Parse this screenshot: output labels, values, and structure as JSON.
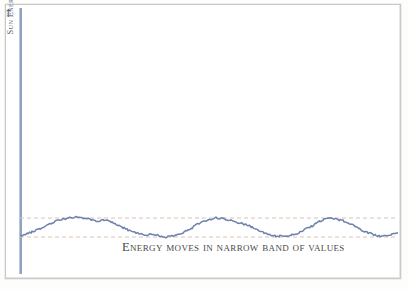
{
  "figure": {
    "background_color": "#ffffff",
    "frame_color": "#c9c9c9"
  },
  "axis": {
    "y_label": "Sun Energy",
    "y_arrow_glyph": "↑",
    "axis_color": "#8fa2bf"
  },
  "caption": {
    "text": "Energy moves in narrow band of values",
    "color": "#4a4a4a"
  },
  "chart_data": {
    "type": "line",
    "title": "",
    "subtitle": "",
    "xlabel": "",
    "ylabel": "Sun Energy",
    "annotations": [
      "Energy moves in narrow band of values"
    ],
    "legend": [],
    "legend_position": "none",
    "grid": false,
    "xlim": [
      0,
      378
    ],
    "ylim": [
      0,
      266
    ],
    "series_color": "#6d82ab",
    "band": {
      "label": "narrow band of values",
      "upper_y": 210,
      "lower_y": 229,
      "line_style": "dashed",
      "color": "#d8c4b4"
    },
    "series": [
      {
        "name": "Sun energy",
        "x": [
          0,
          4,
          8,
          12,
          16,
          20,
          24,
          28,
          32,
          36,
          40,
          44,
          48,
          52,
          56,
          60,
          64,
          68,
          72,
          76,
          80,
          84,
          88,
          92,
          96,
          100,
          104,
          108,
          112,
          116,
          120,
          124,
          128,
          132,
          136,
          140,
          144,
          148,
          152,
          156,
          160,
          164,
          168,
          172,
          176,
          180,
          184,
          188,
          192,
          196,
          200,
          204,
          208,
          212,
          216,
          220,
          224,
          228,
          232,
          236,
          240,
          244,
          248,
          252,
          256,
          260,
          264,
          268,
          272,
          276,
          280,
          284,
          288,
          292,
          296,
          300,
          304,
          308,
          312,
          316,
          320,
          324,
          328,
          332,
          336,
          340,
          344,
          348,
          352,
          356,
          360,
          364,
          368,
          372,
          378
        ],
        "y": [
          228,
          227,
          225,
          224,
          222,
          221,
          219,
          217,
          215,
          213,
          212,
          211,
          210,
          210,
          209,
          209,
          210,
          211,
          212,
          213,
          213,
          212,
          213,
          214,
          216,
          218,
          220,
          222,
          224,
          225,
          226,
          227,
          227,
          226,
          227,
          228,
          229,
          229,
          228,
          227,
          226,
          224,
          222,
          220,
          217,
          215,
          213,
          212,
          211,
          210,
          210,
          211,
          212,
          213,
          214,
          215,
          216,
          217,
          219,
          221,
          223,
          225,
          226,
          227,
          228,
          228,
          229,
          228,
          227,
          226,
          224,
          222,
          220,
          218,
          215,
          213,
          211,
          210,
          210,
          211,
          212,
          213,
          215,
          217,
          219,
          221,
          223,
          225,
          226,
          227,
          228,
          228,
          227,
          226,
          225
        ]
      }
    ]
  }
}
